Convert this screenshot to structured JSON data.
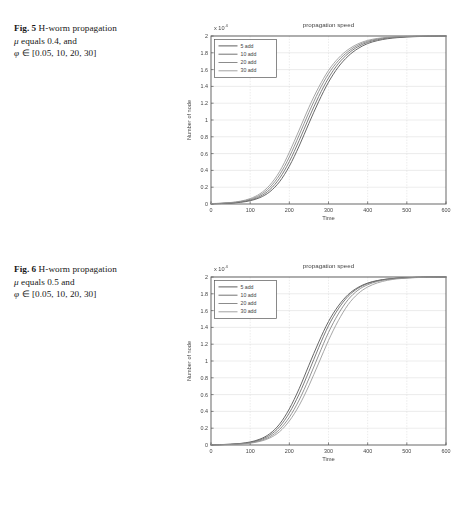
{
  "page": {
    "background": "#ffffff",
    "kind": "scanned-journal-page"
  },
  "figures": [
    {
      "id": "figure-5",
      "caption": {
        "label": "Fig. 5",
        "line1_text": "H-worm propagation",
        "line2_mu": "μ",
        "line2_text": "equals 0.4, and",
        "line3_phi": "φ",
        "line3_text": "∈ [0.05, 10, 20, 30]",
        "full": "Fig. 5 H-worm propagation μ equals 0.4, and φ ∈ [0.05, 10, 20, 30]"
      },
      "chart_data": {
        "type": "line",
        "title": "propagation speed",
        "xlabel": "Time",
        "ylabel": "Number of node",
        "y_multiplier": "x 10",
        "y_exponent": "4",
        "xlim": [
          0,
          600
        ],
        "ylim": [
          0,
          20000
        ],
        "xticks": [
          "0",
          "100",
          "200",
          "300",
          "400",
          "500",
          "600"
        ],
        "xtick_values": [
          0,
          100,
          200,
          300,
          400,
          500,
          600
        ],
        "yticks": [
          "0",
          "0.2",
          "0.4",
          "0.6",
          "0.8",
          "1",
          "1.2",
          "1.4",
          "1.6",
          "1.8",
          "2"
        ],
        "ytick_values": [
          0,
          2000,
          4000,
          6000,
          8000,
          10000,
          12000,
          14000,
          16000,
          18000,
          20000
        ],
        "grid": true,
        "legend_position": "upper-left",
        "legend_entries": [
          "5 add",
          "10 add",
          "20 add",
          "30 add"
        ],
        "x": [
          0,
          25,
          50,
          75,
          100,
          125,
          150,
          175,
          200,
          225,
          250,
          275,
          300,
          325,
          350,
          375,
          400,
          425,
          450,
          475,
          500,
          525,
          550,
          575,
          600
        ],
        "series": [
          {
            "name": "5 add",
            "color": "#3f3f3f",
            "values": [
              30,
              55,
              105,
              200,
              390,
              760,
              1450,
              2650,
              4500,
              6900,
              9600,
              12200,
              14500,
              16300,
              17600,
              18500,
              19100,
              19450,
              19670,
              19800,
              19880,
              19930,
              19960,
              19980,
              20000
            ]
          },
          {
            "name": "10 add",
            "color": "#585858",
            "values": [
              35,
              65,
              125,
              240,
              465,
              900,
              1700,
              3050,
              5050,
              7550,
              10250,
              12800,
              15000,
              16700,
              17900,
              18720,
              19250,
              19560,
              19750,
              19860,
              19920,
              19955,
              19975,
              19990,
              20000
            ]
          },
          {
            "name": "20 add",
            "color": "#767676",
            "values": [
              42,
              78,
              150,
              288,
              555,
              1060,
              1970,
              3450,
              5600,
              8200,
              10900,
              13400,
              15500,
              17050,
              18150,
              18900,
              19370,
              19640,
              19800,
              19890,
              19940,
              19968,
              19984,
              19994,
              20000
            ]
          },
          {
            "name": "30 add",
            "color": "#8e8e8e",
            "values": [
              50,
              92,
              176,
              336,
              645,
              1220,
              2240,
              3850,
              6150,
              8800,
              11500,
              13900,
              15900,
              17350,
              18380,
              19060,
              19480,
              19710,
              19845,
              19915,
              19955,
              19976,
              19989,
              19996,
              20000
            ]
          }
        ]
      }
    },
    {
      "id": "figure-6",
      "caption": {
        "label": "Fig. 6",
        "line1_text": "H-worm propagation",
        "line2_mu": "μ",
        "line2_text": "equals 0.5 and",
        "line3_phi": "φ",
        "line3_text": "∈ [0.05, 10, 20, 30]",
        "full": "Fig. 6 H-worm propagation μ equals 0.5 and φ ∈ [0.05, 10, 20, 30]"
      },
      "chart_data": {
        "type": "line",
        "title": "propagation speed",
        "xlabel": "Time",
        "ylabel": "Number of node",
        "y_multiplier": "x 10",
        "y_exponent": "4",
        "xlim": [
          0,
          600
        ],
        "ylim": [
          0,
          20000
        ],
        "xticks": [
          "0",
          "100",
          "200",
          "300",
          "400",
          "500",
          "600"
        ],
        "xtick_values": [
          0,
          100,
          200,
          300,
          400,
          500,
          600
        ],
        "yticks": [
          "0",
          "0.2",
          "0.4",
          "0.6",
          "0.8",
          "1",
          "1.2",
          "1.4",
          "1.6",
          "1.8",
          "2"
        ],
        "ytick_values": [
          0,
          2000,
          4000,
          6000,
          8000,
          10000,
          12000,
          14000,
          16000,
          18000,
          20000
        ],
        "grid": true,
        "legend_position": "upper-left",
        "legend_entries": [
          "5 add",
          "10 add",
          "20 add",
          "30 add"
        ],
        "x": [
          0,
          25,
          50,
          75,
          100,
          125,
          150,
          175,
          200,
          225,
          250,
          275,
          300,
          325,
          350,
          375,
          400,
          425,
          450,
          475,
          500,
          525,
          550,
          575,
          600
        ],
        "series": [
          {
            "name": "5 add",
            "color": "#3f3f3f",
            "values": [
              25,
              48,
              95,
              185,
              360,
              700,
              1340,
              2480,
              4300,
              6700,
              9500,
              12250,
              14700,
              16550,
              17900,
              18750,
              19280,
              19580,
              19760,
              19865,
              19925,
              19958,
              19978,
              19991,
              20000
            ]
          },
          {
            "name": "10 add",
            "color": "#585858",
            "values": [
              22,
              42,
              82,
              160,
              310,
              605,
              1160,
              2170,
              3820,
              6060,
              8760,
              11600,
              14200,
              16200,
              17700,
              18650,
              19220,
              19550,
              19745,
              19855,
              19920,
              19955,
              19977,
              19990,
              20000
            ]
          },
          {
            "name": "20 add",
            "color": "#767676",
            "values": [
              18,
              35,
              68,
              133,
              260,
              508,
              980,
              1850,
              3300,
              5350,
              7900,
              10700,
              13400,
              15600,
              17300,
              18420,
              19080,
              19470,
              19700,
              19830,
              19905,
              19948,
              19973,
              19988,
              20000
            ]
          },
          {
            "name": "30 add",
            "color": "#8e8e8e",
            "values": [
              15,
              29,
              57,
              112,
              218,
              428,
              830,
              1580,
              2860,
              4700,
              7060,
              9750,
              12450,
              14800,
              16700,
              18000,
              18810,
              19300,
              19600,
              19775,
              19875,
              19932,
              19965,
              19985,
              20000
            ]
          }
        ]
      }
    }
  ]
}
